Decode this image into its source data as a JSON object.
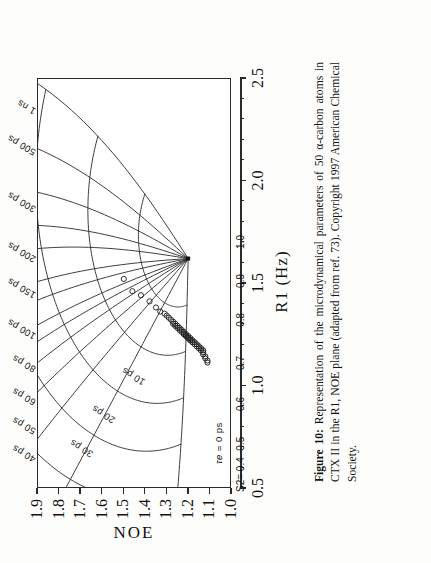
{
  "figure": {
    "caption_label": "Figure 10:",
    "caption_body": "Representation of the microdynamical parameters of 50 α-carbon atoms in CTX II in the R1, NOE plane (adapted from ref. 73).",
    "caption_copyright": "Copyright 1997 American Chemical Society."
  },
  "chart_data": {
    "type": "scatter",
    "title": "",
    "xlabel": "R1 (Hz)",
    "ylabel": "NOE",
    "xlim": [
      0.5,
      2.5
    ],
    "ylim": [
      1.0,
      1.9
    ],
    "xticks": [
      "0.5",
      "1.0",
      "1.5",
      "2.0",
      "2.5"
    ],
    "xtick_values": [
      0.5,
      1.0,
      1.5,
      2.0,
      2.5
    ],
    "yticks": [
      "1.0",
      "1.1",
      "1.2",
      "1.3",
      "1.4",
      "1.5",
      "1.6",
      "1.7",
      "1.8",
      "1.9"
    ],
    "ytick_values": [
      1.0,
      1.1,
      1.2,
      1.3,
      1.4,
      1.5,
      1.6,
      1.7,
      1.8,
      1.9
    ],
    "grid": false,
    "legend_position": "none",
    "marker": "open-circle",
    "n_points": 50,
    "overlay": "model-free parameter mesh: S² isolines crossing τe isolines",
    "s2_axis_label": "S2= 0.4",
    "s2_tick_labels": [
      "0.4",
      "0.5",
      "0.6",
      "0.7",
      "0.8",
      "0.9",
      "1.0"
    ],
    "s2_tick_values": [
      0.4,
      0.5,
      0.6,
      0.7,
      0.8,
      0.9,
      1.0
    ],
    "tau_axis_label": "τe =",
    "tau_zero_label": "0 ps",
    "tau_labels": [
      "10 ps",
      "20 ps",
      "30 ps",
      "40 ps",
      "50 ps",
      "60 ps",
      "80 ps",
      "100 ps",
      "150 ps",
      "200 ps",
      "300 ps",
      "500 ps",
      "1 ns"
    ],
    "tau_values_ps": [
      10,
      20,
      30,
      40,
      50,
      60,
      80,
      100,
      150,
      200,
      300,
      500,
      1000
    ],
    "points": [
      {
        "r1": 1.52,
        "noe": 1.5
      },
      {
        "r1": 1.46,
        "noe": 1.46
      },
      {
        "r1": 1.44,
        "noe": 1.42
      },
      {
        "r1": 1.41,
        "noe": 1.38
      },
      {
        "r1": 1.38,
        "noe": 1.35
      },
      {
        "r1": 1.36,
        "noe": 1.33
      },
      {
        "r1": 1.35,
        "noe": 1.31
      },
      {
        "r1": 1.34,
        "noe": 1.3
      },
      {
        "r1": 1.33,
        "noe": 1.29
      },
      {
        "r1": 1.32,
        "noe": 1.28
      },
      {
        "r1": 1.31,
        "noe": 1.27
      },
      {
        "r1": 1.3,
        "noe": 1.27
      },
      {
        "r1": 1.3,
        "noe": 1.26
      },
      {
        "r1": 1.29,
        "noe": 1.26
      },
      {
        "r1": 1.29,
        "noe": 1.25
      },
      {
        "r1": 1.28,
        "noe": 1.25
      },
      {
        "r1": 1.28,
        "noe": 1.24
      },
      {
        "r1": 1.27,
        "noe": 1.24
      },
      {
        "r1": 1.27,
        "noe": 1.23
      },
      {
        "r1": 1.26,
        "noe": 1.23
      },
      {
        "r1": 1.26,
        "noe": 1.22
      },
      {
        "r1": 1.25,
        "noe": 1.22
      },
      {
        "r1": 1.25,
        "noe": 1.22
      },
      {
        "r1": 1.25,
        "noe": 1.21
      },
      {
        "r1": 1.24,
        "noe": 1.21
      },
      {
        "r1": 1.24,
        "noe": 1.21
      },
      {
        "r1": 1.24,
        "noe": 1.2
      },
      {
        "r1": 1.23,
        "noe": 1.2
      },
      {
        "r1": 1.23,
        "noe": 1.2
      },
      {
        "r1": 1.23,
        "noe": 1.19
      },
      {
        "r1": 1.22,
        "noe": 1.19
      },
      {
        "r1": 1.22,
        "noe": 1.19
      },
      {
        "r1": 1.22,
        "noe": 1.18
      },
      {
        "r1": 1.21,
        "noe": 1.18
      },
      {
        "r1": 1.21,
        "noe": 1.18
      },
      {
        "r1": 1.21,
        "noe": 1.17
      },
      {
        "r1": 1.2,
        "noe": 1.17
      },
      {
        "r1": 1.2,
        "noe": 1.16
      },
      {
        "r1": 1.19,
        "noe": 1.16
      },
      {
        "r1": 1.19,
        "noe": 1.15
      },
      {
        "r1": 1.18,
        "noe": 1.15
      },
      {
        "r1": 1.18,
        "noe": 1.14
      },
      {
        "r1": 1.17,
        "noe": 1.14
      },
      {
        "r1": 1.17,
        "noe": 1.13
      },
      {
        "r1": 1.16,
        "noe": 1.13
      },
      {
        "r1": 1.15,
        "noe": 1.13
      },
      {
        "r1": 1.14,
        "noe": 1.12
      },
      {
        "r1": 1.13,
        "noe": 1.12
      },
      {
        "r1": 1.12,
        "noe": 1.11
      },
      {
        "r1": 1.11,
        "noe": 1.11
      }
    ]
  },
  "colors": {
    "ink": "#2a2a2a",
    "paper": "#fdfdfb",
    "curve": "#333333"
  }
}
